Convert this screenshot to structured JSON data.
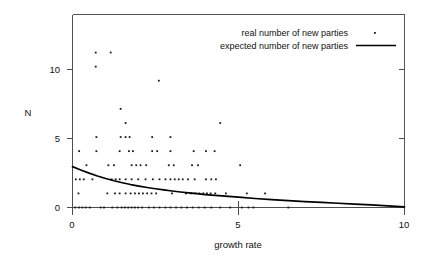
{
  "chart_data": {
    "type": "scatter",
    "title": "",
    "xlabel": "growth rate",
    "ylabel": "N",
    "xlim": [
      0,
      10
    ],
    "ylim": [
      0,
      13.7
    ],
    "xticks": [
      0,
      5,
      10
    ],
    "xticklabels": [
      "0",
      "5",
      "10"
    ],
    "yticks": [
      0,
      5,
      10
    ],
    "yticklabels": [
      "0",
      "5",
      "10"
    ],
    "grid": false,
    "legend_position": "top-right",
    "series": [
      {
        "name": "real number of new parties",
        "type": "scatter",
        "marker": "point",
        "color": "#1a1a1a",
        "points": [
          [
            0.7,
            11
          ],
          [
            1.15,
            11
          ],
          [
            0.7,
            10
          ],
          [
            2.6,
            9
          ],
          [
            1.45,
            7
          ],
          [
            1.6,
            6
          ],
          [
            4.45,
            6
          ],
          [
            0.72,
            5
          ],
          [
            1.45,
            5
          ],
          [
            1.6,
            5
          ],
          [
            1.72,
            5
          ],
          [
            2.4,
            5
          ],
          [
            2.95,
            5
          ],
          [
            0.2,
            4
          ],
          [
            0.72,
            4
          ],
          [
            1.42,
            4
          ],
          [
            1.7,
            4
          ],
          [
            1.82,
            4
          ],
          [
            2.4,
            4
          ],
          [
            2.55,
            4
          ],
          [
            2.95,
            4
          ],
          [
            3.65,
            4
          ],
          [
            4.02,
            4
          ],
          [
            4.28,
            4
          ],
          [
            0.42,
            3
          ],
          [
            1.08,
            3
          ],
          [
            1.25,
            3
          ],
          [
            1.78,
            3
          ],
          [
            1.92,
            3
          ],
          [
            2.05,
            3
          ],
          [
            2.22,
            3
          ],
          [
            2.9,
            3
          ],
          [
            3.05,
            3
          ],
          [
            3.6,
            3
          ],
          [
            3.78,
            3
          ],
          [
            5.05,
            3
          ],
          [
            0.1,
            2
          ],
          [
            0.22,
            2
          ],
          [
            0.34,
            2
          ],
          [
            0.6,
            2
          ],
          [
            1.18,
            2
          ],
          [
            1.3,
            2
          ],
          [
            1.42,
            2
          ],
          [
            1.6,
            2
          ],
          [
            1.78,
            2
          ],
          [
            1.98,
            2
          ],
          [
            2.2,
            2
          ],
          [
            2.42,
            2
          ],
          [
            2.62,
            2
          ],
          [
            2.8,
            2
          ],
          [
            2.95,
            2
          ],
          [
            3.08,
            2
          ],
          [
            3.2,
            2
          ],
          [
            3.32,
            2
          ],
          [
            3.48,
            2
          ],
          [
            3.68,
            2
          ],
          [
            4.02,
            2
          ],
          [
            4.18,
            2
          ],
          [
            4.32,
            2
          ],
          [
            0.18,
            1
          ],
          [
            1.05,
            1
          ],
          [
            1.28,
            1
          ],
          [
            1.42,
            1
          ],
          [
            1.6,
            1
          ],
          [
            1.75,
            1
          ],
          [
            1.88,
            1
          ],
          [
            2.0,
            1
          ],
          [
            2.12,
            1
          ],
          [
            2.25,
            1
          ],
          [
            2.38,
            1
          ],
          [
            2.52,
            1
          ],
          [
            3.0,
            1
          ],
          [
            3.42,
            1
          ],
          [
            3.58,
            1
          ],
          [
            3.7,
            1
          ],
          [
            3.82,
            1
          ],
          [
            3.94,
            1
          ],
          [
            4.05,
            1
          ],
          [
            4.16,
            1
          ],
          [
            4.3,
            1
          ],
          [
            4.62,
            1
          ],
          [
            5.25,
            1
          ],
          [
            5.8,
            1
          ],
          [
            0.08,
            0
          ],
          [
            0.2,
            0
          ],
          [
            0.3,
            0
          ],
          [
            0.4,
            0
          ],
          [
            0.52,
            0
          ],
          [
            0.85,
            0
          ],
          [
            0.95,
            0
          ],
          [
            1.2,
            0
          ],
          [
            1.35,
            0
          ],
          [
            1.48,
            0
          ],
          [
            1.58,
            0
          ],
          [
            1.68,
            0
          ],
          [
            1.78,
            0
          ],
          [
            1.88,
            0
          ],
          [
            1.98,
            0
          ],
          [
            2.1,
            0
          ],
          [
            2.3,
            0
          ],
          [
            2.45,
            0
          ],
          [
            2.62,
            0
          ],
          [
            2.8,
            0
          ],
          [
            2.95,
            0
          ],
          [
            3.12,
            0
          ],
          [
            3.28,
            0
          ],
          [
            3.45,
            0
          ],
          [
            3.62,
            0
          ],
          [
            3.8,
            0
          ],
          [
            3.98,
            0
          ],
          [
            4.18,
            0
          ],
          [
            4.45,
            0
          ],
          [
            4.75,
            0
          ],
          [
            5.1,
            0
          ],
          [
            5.3,
            0
          ],
          [
            5.45,
            0
          ],
          [
            6.5,
            0
          ]
        ]
      },
      {
        "name": "expected number of new parties",
        "type": "line",
        "color": "#000000",
        "curve": [
          [
            0.0,
            2.9
          ],
          [
            0.25,
            2.66
          ],
          [
            0.5,
            2.44
          ],
          [
            0.75,
            2.24
          ],
          [
            1.0,
            2.06
          ],
          [
            1.25,
            1.9
          ],
          [
            1.5,
            1.76
          ],
          [
            1.75,
            1.63
          ],
          [
            2.0,
            1.52
          ],
          [
            2.25,
            1.42
          ],
          [
            2.5,
            1.33
          ],
          [
            2.75,
            1.25
          ],
          [
            3.0,
            1.17
          ],
          [
            3.25,
            1.1
          ],
          [
            3.5,
            1.04
          ],
          [
            3.75,
            0.98
          ],
          [
            4.0,
            0.92
          ],
          [
            4.5,
            0.82
          ],
          [
            5.0,
            0.73
          ],
          [
            5.5,
            0.64
          ],
          [
            6.0,
            0.56
          ],
          [
            6.5,
            0.49
          ],
          [
            7.0,
            0.42
          ],
          [
            7.5,
            0.36
          ],
          [
            8.0,
            0.3
          ],
          [
            8.5,
            0.24
          ],
          [
            9.0,
            0.18
          ],
          [
            9.5,
            0.11
          ],
          [
            10.0,
            0.04
          ]
        ]
      }
    ]
  },
  "legend": {
    "items": [
      {
        "label": "real number of new parties",
        "marker": "point"
      },
      {
        "label": "expected number of new parties",
        "marker": "line"
      }
    ]
  },
  "axes": {
    "y_title": "N",
    "x_title": "growth rate",
    "x_tick_labels": [
      "0",
      "5",
      "10"
    ],
    "y_tick_labels": [
      "0",
      "5",
      "10"
    ]
  },
  "colors": {
    "point": "#1a1a1a",
    "curve": "#000000",
    "axis": "#4d4d4d",
    "background": "#ffffff"
  }
}
